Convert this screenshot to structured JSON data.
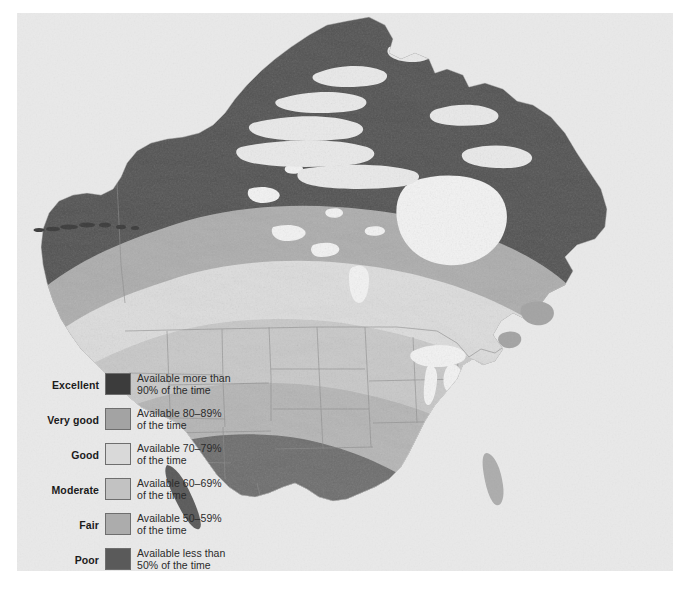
{
  "figure": {
    "background_color": "#ffffff",
    "panel_color": "#e9e9e9"
  },
  "legend": {
    "entries": [
      {
        "label": "Excellent",
        "description": "Available more than\n90% of the time",
        "color": "#3c3c3c",
        "range_low": 90,
        "range_high": 100
      },
      {
        "label": "Very good",
        "description": "Available 80–89%\nof the time",
        "color": "#a3a3a3",
        "range_low": 80,
        "range_high": 89
      },
      {
        "label": "Good",
        "description": "Available 70–79%\nof the time",
        "color": "#d9d9d9",
        "range_low": 70,
        "range_high": 79
      },
      {
        "label": "Moderate",
        "description": "Available 60–69%\nof the time",
        "color": "#c2c2c2",
        "range_low": 60,
        "range_high": 69
      },
      {
        "label": "Fair",
        "description": "Available 50–59%\nof the time",
        "color": "#acacac",
        "range_low": 50,
        "range_high": 59
      },
      {
        "label": "Poor",
        "description": "Available less than\n50% of the time",
        "color": "#5a5a5a",
        "range_low": 0,
        "range_high": 49
      }
    ]
  },
  "map": {
    "region": "North America",
    "ocean_color": "#e9e9e9",
    "border_color": "#8a8a8a",
    "lake_color": "#f3f3f3",
    "bands": [
      {
        "name": "Excellent",
        "color": "#3c3c3c"
      },
      {
        "name": "Very good",
        "color": "#a3a3a3"
      },
      {
        "name": "Good",
        "color": "#d9d9d9"
      },
      {
        "name": "Moderate",
        "color": "#c2c2c2"
      },
      {
        "name": "Fair",
        "color": "#acacac"
      },
      {
        "name": "Poor",
        "color": "#5a5a5a"
      }
    ]
  }
}
